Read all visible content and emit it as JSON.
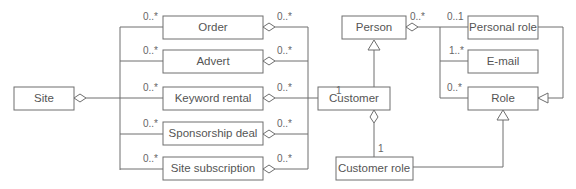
{
  "diagram": {
    "type": "UML class diagram",
    "classes": {
      "site": "Site",
      "order": "Order",
      "advert": "Advert",
      "keyword_rental": "Keyword rental",
      "sponsorship_deal": "Sponsorship deal",
      "site_subscription": "Site subscription",
      "person": "Person",
      "customer": "Customer",
      "customer_role": "Customer role",
      "personal_role": "Personal role",
      "email": "E-mail",
      "role": "Role"
    },
    "multiplicities": {
      "site_order": "0..*",
      "site_advert": "0..*",
      "site_keyword": "0..*",
      "site_sponsorship": "0..*",
      "site_subscription": "0..*",
      "order_customer": "0..*",
      "advert_customer": "0..*",
      "keyword_customer": "0..*",
      "sponsorship_customer": "0..*",
      "subscription_customer": "0..*",
      "customer_end": "1",
      "person_end": "0..*",
      "personal_role_end": "0..1",
      "email_end": "1..*",
      "role_end": "0..*",
      "customer_role_end": "1"
    }
  }
}
